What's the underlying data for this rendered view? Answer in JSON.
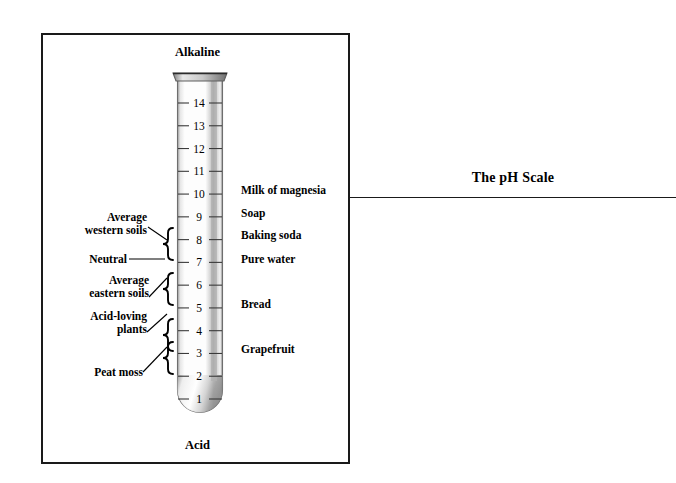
{
  "caption": {
    "title": "The pH Scale"
  },
  "figure": {
    "top_label": "Alkaline",
    "bottom_label": "Acid",
    "tube_name": "test-tube"
  },
  "chart_data": {
    "type": "bar",
    "title": "The pH Scale",
    "subtitle": "",
    "xlabel": "",
    "ylabel": "pH",
    "ylim": [
      1,
      14
    ],
    "grid": false,
    "legend": null,
    "orientation": "vertical",
    "axis_top_annotation": "Alkaline",
    "axis_bottom_annotation": "Acid",
    "categories": [
      "1",
      "2",
      "3",
      "4",
      "5",
      "6",
      "7",
      "8",
      "9",
      "10",
      "11",
      "12",
      "13",
      "14"
    ],
    "tick_labels": [
      "1",
      "2",
      "3",
      "4",
      "5",
      "6",
      "7",
      "8",
      "9",
      "10",
      "11",
      "12",
      "13",
      "14"
    ],
    "values": [
      1,
      2,
      3,
      4,
      5,
      6,
      7,
      8,
      9,
      10,
      11,
      12,
      13,
      14
    ],
    "substances": [
      {
        "name": "Milk of magnesia",
        "ph": 10
      },
      {
        "name": "Soap",
        "ph": 9
      },
      {
        "name": "Baking soda",
        "ph": 8
      },
      {
        "name": "Pure water",
        "ph": 7
      },
      {
        "name": "Bread",
        "ph": 5
      },
      {
        "name": "Grapefruit",
        "ph": 3
      }
    ],
    "ranges": [
      {
        "name": "Average western soils",
        "ph_min": 7,
        "ph_max": 8
      },
      {
        "name": "Neutral",
        "ph_min": 7,
        "ph_max": 7
      },
      {
        "name": "Average eastern soils",
        "ph_min": 6,
        "ph_max": 7
      },
      {
        "name": "Acid-loving plants",
        "ph_min": 4,
        "ph_max": 5
      },
      {
        "name": "Peat moss",
        "ph_min": 3,
        "ph_max": 4
      }
    ]
  },
  "scale": {
    "ticks": [
      {
        "value": "14"
      },
      {
        "value": "13"
      },
      {
        "value": "12"
      },
      {
        "value": "11"
      },
      {
        "value": "10"
      },
      {
        "value": "9"
      },
      {
        "value": "8"
      },
      {
        "value": "7"
      },
      {
        "value": "6"
      },
      {
        "value": "5"
      },
      {
        "value": "4"
      },
      {
        "value": "3"
      },
      {
        "value": "2"
      },
      {
        "value": "1"
      }
    ]
  },
  "substances": [
    {
      "label": "Milk of magnesia"
    },
    {
      "label": "Soap"
    },
    {
      "label": "Baking soda"
    },
    {
      "label": "Pure water"
    },
    {
      "label": "Bread"
    },
    {
      "label": "Grapefruit"
    }
  ],
  "annotations": [
    {
      "line1": "Average",
      "line2": "western soils"
    },
    {
      "line1": "Neutral",
      "line2": ""
    },
    {
      "line1": "Average",
      "line2": "eastern soils"
    },
    {
      "line1": "Acid-loving",
      "line2": "plants"
    },
    {
      "line1": "Peat moss",
      "line2": ""
    }
  ],
  "colors": {
    "frame": "#1a1a1a",
    "ink": "#000000",
    "glass_edge": "#8a8a8a",
    "glass_fill": "#fbfbfb",
    "glass_shadow": "#b9b9b9"
  }
}
